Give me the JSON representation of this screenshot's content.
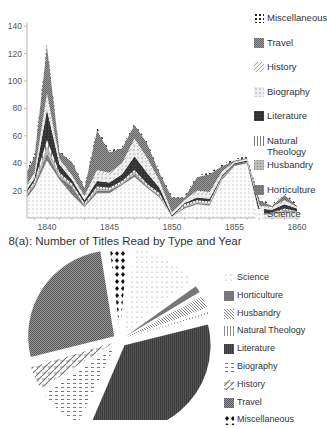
{
  "chart_data": [
    {
      "type": "area",
      "stacked": true,
      "title": "8(a): Number of Titles Read by Type and Year",
      "xlabel": "",
      "ylabel": "",
      "x": [
        1838,
        1839,
        1840,
        1841,
        1842,
        1843,
        1844,
        1845,
        1846,
        1847,
        1848,
        1849,
        1850,
        1851,
        1852,
        1853,
        1854,
        1855,
        1856,
        1857,
        1858,
        1859,
        1860
      ],
      "xticks": [
        "1840",
        "1845",
        "1850",
        "1855",
        "1860"
      ],
      "yticks": [
        "20",
        "40",
        "60",
        "80",
        "100",
        "120",
        "140"
      ],
      "ylim": [
        0,
        140
      ],
      "xlim": [
        1838.4,
        1860
      ],
      "grid": false,
      "legend_position": "right",
      "series": [
        {
          "name": "Science",
          "values": [
            15,
            22,
            42,
            28,
            17,
            8,
            18,
            18,
            24,
            30,
            22,
            15,
            1,
            7,
            10,
            9,
            28,
            38,
            40,
            2,
            3,
            4,
            4
          ]
        },
        {
          "name": "Horticulture",
          "values": [
            2,
            2,
            5,
            2,
            6,
            1,
            2,
            2,
            1,
            2,
            1,
            1,
            0,
            1,
            1,
            1,
            1,
            1,
            1,
            1,
            1,
            1,
            1
          ]
        },
        {
          "name": "Husbandry",
          "values": [
            1,
            2,
            6,
            2,
            1,
            1,
            2,
            1,
            1,
            2,
            1,
            1,
            0,
            1,
            1,
            1,
            1,
            0,
            0,
            0,
            0,
            1,
            0
          ]
        },
        {
          "name": "Natural Theology",
          "values": [
            1,
            1,
            4,
            1,
            1,
            1,
            1,
            1,
            1,
            1,
            1,
            1,
            0,
            1,
            1,
            1,
            0,
            0,
            0,
            0,
            0,
            1,
            0
          ]
        },
        {
          "name": "Literature",
          "values": [
            2,
            2,
            22,
            6,
            3,
            2,
            4,
            4,
            5,
            10,
            8,
            4,
            1,
            1,
            2,
            2,
            1,
            1,
            1,
            4,
            2,
            3,
            2
          ]
        },
        {
          "name": "Biography",
          "values": [
            2,
            3,
            8,
            3,
            2,
            2,
            6,
            5,
            6,
            10,
            8,
            4,
            1,
            1,
            4,
            4,
            2,
            1,
            1,
            1,
            1,
            2,
            1
          ]
        },
        {
          "name": "History",
          "values": [
            1,
            1,
            4,
            1,
            1,
            1,
            2,
            2,
            2,
            3,
            3,
            1,
            1,
            1,
            1,
            1,
            1,
            0,
            0,
            1,
            1,
            1,
            0
          ]
        },
        {
          "name": "Travel",
          "values": [
            10,
            12,
            35,
            5,
            10,
            6,
            29,
            15,
            11,
            10,
            11,
            6,
            11,
            2,
            10,
            13,
            4,
            1,
            1,
            4,
            1,
            4,
            1
          ]
        },
        {
          "name": "Miscellaneous",
          "values": [
            2,
            2,
            2,
            1,
            1,
            1,
            2,
            1,
            1,
            1,
            1,
            1,
            1,
            1,
            1,
            1,
            1,
            1,
            1,
            1,
            1,
            1,
            1
          ]
        }
      ]
    },
    {
      "type": "pie",
      "title": "",
      "exploded": true,
      "categories": [
        "Science",
        "Horticulture",
        "Husbandry",
        "Natural Theology",
        "Literature",
        "Biography",
        "History",
        "Travel",
        "Miscellaneous"
      ],
      "values": [
        13,
        2,
        3,
        1,
        36,
        9,
        5,
        27,
        4
      ],
      "legend_position": "right"
    }
  ],
  "caption_a": "8(a): Number of Titles Read by Type and Year",
  "legend_a": [
    "Miscellaneous",
    "Travel",
    "History",
    "Biography",
    "Literature",
    "Natural Theology",
    "Husbandry",
    "Horticulture",
    "Science"
  ],
  "legend_b": [
    "Science",
    "Horticulture",
    "Husbandry",
    "Natural Theology",
    "Literature",
    "Biography",
    "History",
    "Travel",
    "Miscellaneous"
  ]
}
